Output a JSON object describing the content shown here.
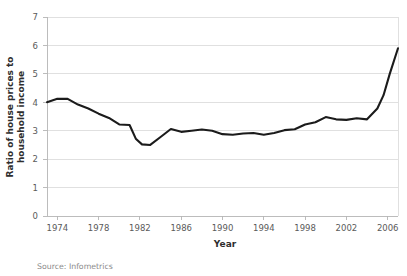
{
  "source_note": "Source: Infometrics",
  "chart_data": {
    "type": "line",
    "title": "",
    "xlabel": "Year",
    "ylabel": "Ratio of house prices to household income",
    "ylabel_line1": "Ratio of house prices to",
    "ylabel_line2": "household income",
    "xlim": [
      1974,
      2008
    ],
    "ylim": [
      0,
      7
    ],
    "ytick_values": [
      0,
      1,
      2,
      3,
      4,
      5,
      6,
      7
    ],
    "ytick_labels": [
      "0",
      "1",
      "2",
      "3",
      "4",
      "5",
      "6",
      "7"
    ],
    "xtick_values": [
      1974,
      1978,
      1982,
      1986,
      1990,
      1994,
      1998,
      2002,
      2006
    ],
    "xtick_labels": [
      "1974",
      "1978",
      "1982",
      "1986",
      "1990",
      "1994",
      "1998",
      "2002",
      "2006"
    ],
    "grid": true,
    "legend": false,
    "line_color": "#1b1b1b",
    "series": [
      {
        "name": "Ratio of house prices to household income",
        "x": [
          1974,
          1975,
          1976,
          1977,
          1978,
          1979,
          1980,
          1981,
          1982,
          1983,
          1984,
          1985,
          1986,
          1987,
          1988,
          1989,
          1990,
          1991,
          1992,
          1993,
          1994,
          1995,
          1996,
          1997,
          1998,
          1999,
          2000,
          2001,
          2002,
          2003,
          2004,
          2005,
          2006,
          2007,
          2008
        ],
        "values": [
          4.0,
          4.15,
          4.15,
          3.95,
          3.8,
          3.6,
          3.4,
          3.2,
          3.2,
          2.75,
          2.5,
          2.5,
          2.8,
          3.1,
          3.0,
          3.05,
          3.1,
          3.05,
          2.9,
          2.9,
          2.9,
          2.85,
          3.0,
          3.0,
          3.2,
          3.3,
          3.45,
          3.4,
          3.35,
          3.4,
          3.35,
          3.6,
          3.75,
          4.1,
          4.35
        ]
      }
    ],
    "annotations": {
      "start_value": 4.0,
      "trough_value": 2.5,
      "trough_year": 1984,
      "peak_value": 5.9,
      "peak_year": 2007,
      "end_value": 5.2
    },
    "series_full": {
      "x": [
        1974,
        1975,
        1976,
        1977,
        1978,
        1979,
        1980,
        1981,
        1982,
        1982.6,
        1983.2,
        1984,
        1985,
        1986,
        1987,
        1988,
        1989,
        1990,
        1991,
        1992,
        1993,
        1994,
        1995,
        1996,
        1997,
        1998,
        1999,
        2000,
        2001,
        2002,
        2003,
        2004,
        2005,
        2006,
        2006.6,
        2007.2,
        2008
      ],
      "values": [
        4.0,
        4.12,
        4.12,
        3.92,
        3.78,
        3.6,
        3.45,
        3.22,
        3.2,
        2.72,
        2.52,
        2.5,
        2.78,
        3.06,
        2.96,
        3.0,
        3.04,
        3.0,
        2.88,
        2.86,
        2.9,
        2.92,
        2.86,
        2.92,
        3.02,
        3.05,
        3.22,
        3.3,
        3.48,
        3.4,
        3.38,
        3.44,
        3.4,
        3.78,
        4.25,
        5.0,
        5.9
      ]
    }
  }
}
